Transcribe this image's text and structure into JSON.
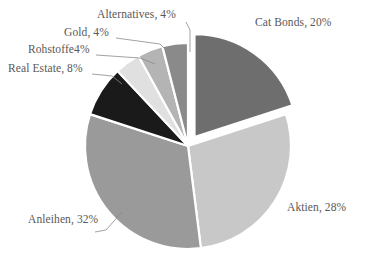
{
  "chart_data": {
    "type": "pie",
    "title": "",
    "subtitle": "",
    "xlabel": "",
    "ylabel": "",
    "legend_position": "none",
    "grid": false,
    "value_unit": "%",
    "total": 100,
    "categories": [
      "Cat Bonds",
      "Aktien",
      "Anleihen",
      "Real Estate",
      "Rohstoffe",
      "Gold",
      "Alternatives"
    ],
    "values": [
      20,
      28,
      32,
      8,
      4,
      4,
      4
    ],
    "labels": [
      "Cat Bonds, 20%",
      "Aktien, 28%",
      "Anleihen, 32%",
      "Real Estate, 8%",
      "Rohstoffe4%",
      "Gold, 4%",
      "Alternatives, 4%"
    ],
    "colors": [
      "#6e6e6e",
      "#c8c8c8",
      "#9a9a9a",
      "#1a1a1a",
      "#e0e0e0",
      "#b4b4b4",
      "#8a8a8a"
    ],
    "slices": [
      {
        "name": "Cat Bonds",
        "value": 20,
        "label": "Cat Bonds, 20%",
        "color": "#6e6e6e",
        "exploded": true
      },
      {
        "name": "Aktien",
        "value": 28,
        "label": "Aktien, 28%",
        "color": "#c8c8c8",
        "exploded": false
      },
      {
        "name": "Anleihen",
        "value": 32,
        "label": "Anleihen, 32%",
        "color": "#9a9a9a",
        "exploded": false
      },
      {
        "name": "Real Estate",
        "value": 8,
        "label": "Real Estate, 8%",
        "color": "#1a1a1a",
        "exploded": false
      },
      {
        "name": "Rohstoffe",
        "value": 4,
        "label": "Rohstoffe4%",
        "color": "#e0e0e0",
        "exploded": false
      },
      {
        "name": "Gold",
        "value": 4,
        "label": "Gold, 4%",
        "color": "#b4b4b4",
        "exploded": false
      },
      {
        "name": "Alternatives",
        "value": 4,
        "label": "Alternatives, 4%",
        "color": "#8a8a8a",
        "exploded": false
      }
    ]
  },
  "chart": {
    "labels": {
      "cat_bonds": "Cat Bonds, 20%",
      "aktien": "Aktien, 28%",
      "anleihen": "Anleihen, 32%",
      "real_estate": "Real Estate, 8%",
      "rohstoffe": "Rohstoffe4%",
      "gold": "Gold, 4%",
      "alternatives": "Alternatives, 4%"
    },
    "colors": {
      "cat_bonds": "#6e6e6e",
      "aktien": "#c8c8c8",
      "anleihen": "#9a9a9a",
      "real_estate": "#1a1a1a",
      "rohstoffe": "#e0e0e0",
      "gold": "#b4b4b4",
      "alternatives": "#8a8a8a",
      "background": "#ffffff",
      "text": "#585858",
      "leader_line": "#8a8a8a",
      "slice_border": "#ffffff"
    }
  }
}
